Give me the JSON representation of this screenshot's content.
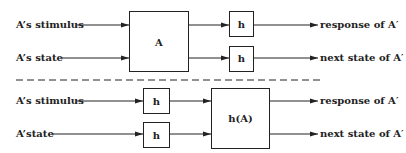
{
  "top": {
    "inputs": [
      "A’s stimulus",
      "A’s state"
    ],
    "main_box": "A",
    "h_boxes": [
      "h",
      "h"
    ],
    "outputs": [
      "response of A′",
      "next state of A′"
    ]
  },
  "bottom": {
    "inputs": [
      "A’s stimulus",
      "A’state"
    ],
    "h_boxes": [
      "h",
      "h"
    ],
    "main_box": "h(A)",
    "outputs": [
      "response of A′",
      "next state of A′"
    ]
  },
  "colors": {
    "stroke": "#222222",
    "background": "#ffffff"
  }
}
